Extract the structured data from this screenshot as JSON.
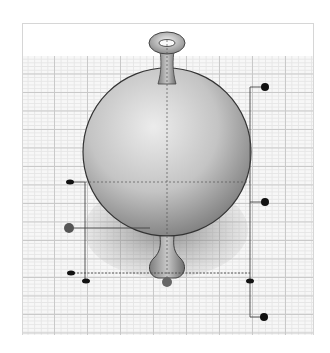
{
  "diagram": {
    "title": "",
    "colors": {
      "background": "#ffffff",
      "grid_major": "#c9c9c9",
      "grid_minor": "#e6e6e6",
      "frame_border": "#d6d6d6",
      "outline": "#333333",
      "callout_line": "#444444",
      "callout_dot": "#111111",
      "center_marker": "#555555"
    },
    "callouts": [
      {
        "id": "top-right",
        "label": ""
      },
      {
        "id": "mid-right",
        "label": ""
      },
      {
        "id": "bottom-right",
        "label": ""
      },
      {
        "id": "left-upper",
        "label": ""
      },
      {
        "id": "left-center",
        "label": ""
      },
      {
        "id": "left-lower",
        "label": ""
      },
      {
        "id": "bottom-center",
        "label": ""
      }
    ]
  }
}
